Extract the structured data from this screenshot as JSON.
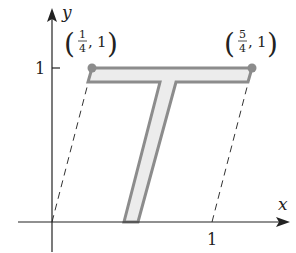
{
  "axes": {
    "x_label": "x",
    "y_label": "y",
    "x_tick_label": "1",
    "y_tick_label": "1"
  },
  "points": [
    {
      "label_num": "1",
      "label_den": "4",
      "label_y": "1",
      "x": 0.25,
      "y": 1
    },
    {
      "label_num": "5",
      "label_den": "4",
      "label_y": "1",
      "x": 1.25,
      "y": 1
    }
  ],
  "colors": {
    "shape_fill": "#ececec",
    "shape_stroke": "#8c8c8c",
    "axis": "#222222",
    "point": "#8c8c8c"
  }
}
